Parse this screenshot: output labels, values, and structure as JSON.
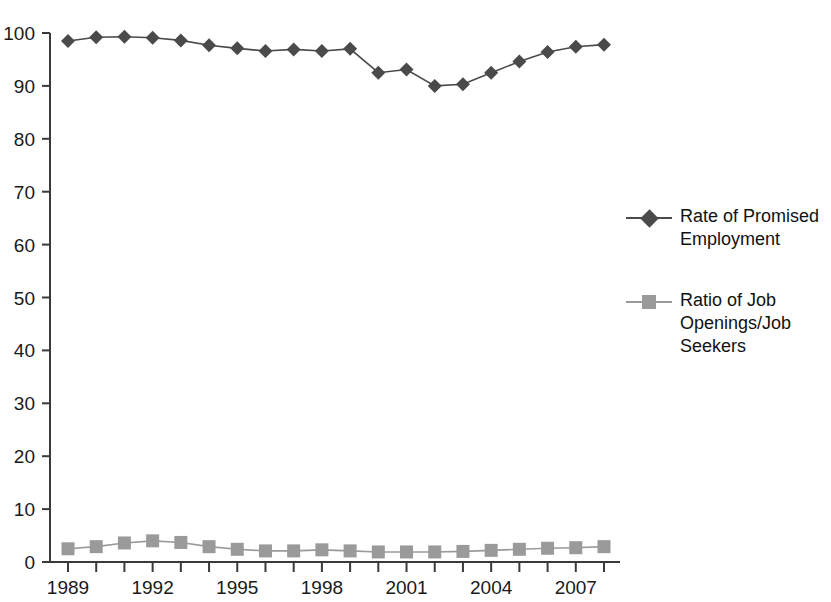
{
  "chart_data": {
    "type": "line",
    "title": "",
    "subtitle": "",
    "xlabel": "",
    "ylabel": "",
    "ylim": [
      0,
      100
    ],
    "ytick_step": 10,
    "yticks": [
      0,
      10,
      20,
      30,
      40,
      50,
      60,
      70,
      80,
      90,
      100
    ],
    "x": [
      1989,
      1990,
      1991,
      1992,
      1993,
      1994,
      1995,
      1996,
      1997,
      1998,
      1999,
      2000,
      2001,
      2002,
      2003,
      2004,
      2005,
      2006,
      2007,
      2008
    ],
    "xtick_labels": [
      "1989",
      "1992",
      "1995",
      "1998",
      "2001",
      "2004",
      "2007"
    ],
    "xtick_label_years": [
      1989,
      1992,
      1995,
      1998,
      2001,
      2004,
      2007
    ],
    "grid": false,
    "legend_position": "right",
    "series": [
      {
        "name": "Rate of Promised Employment",
        "marker": "diamond",
        "color": "#4a4a4a",
        "values": [
          98.5,
          99.2,
          99.3,
          99.1,
          98.6,
          97.7,
          97.1,
          96.6,
          96.9,
          96.6,
          97.0,
          92.5,
          93.1,
          90.0,
          90.3,
          92.5,
          94.6,
          96.4,
          97.4,
          97.8
        ]
      },
      {
        "name": "Ratio of Job Openings/Job Seekers",
        "marker": "square",
        "color": "#9a9a9a",
        "values": [
          2.5,
          2.9,
          3.6,
          4.0,
          3.7,
          2.9,
          2.4,
          2.1,
          2.1,
          2.3,
          2.1,
          1.9,
          1.9,
          1.9,
          2.0,
          2.2,
          2.4,
          2.6,
          2.7,
          2.9
        ]
      }
    ]
  },
  "legend": {
    "entries": [
      {
        "label": "Rate of Promised\nEmployment",
        "marker": "diamond",
        "color": "#4a4a4a"
      },
      {
        "label": "Ratio of Job\nOpenings/Job\nSeekers",
        "marker": "square",
        "color": "#9a9a9a"
      }
    ]
  },
  "axes": {
    "axis_color": "#3a3a3a"
  }
}
